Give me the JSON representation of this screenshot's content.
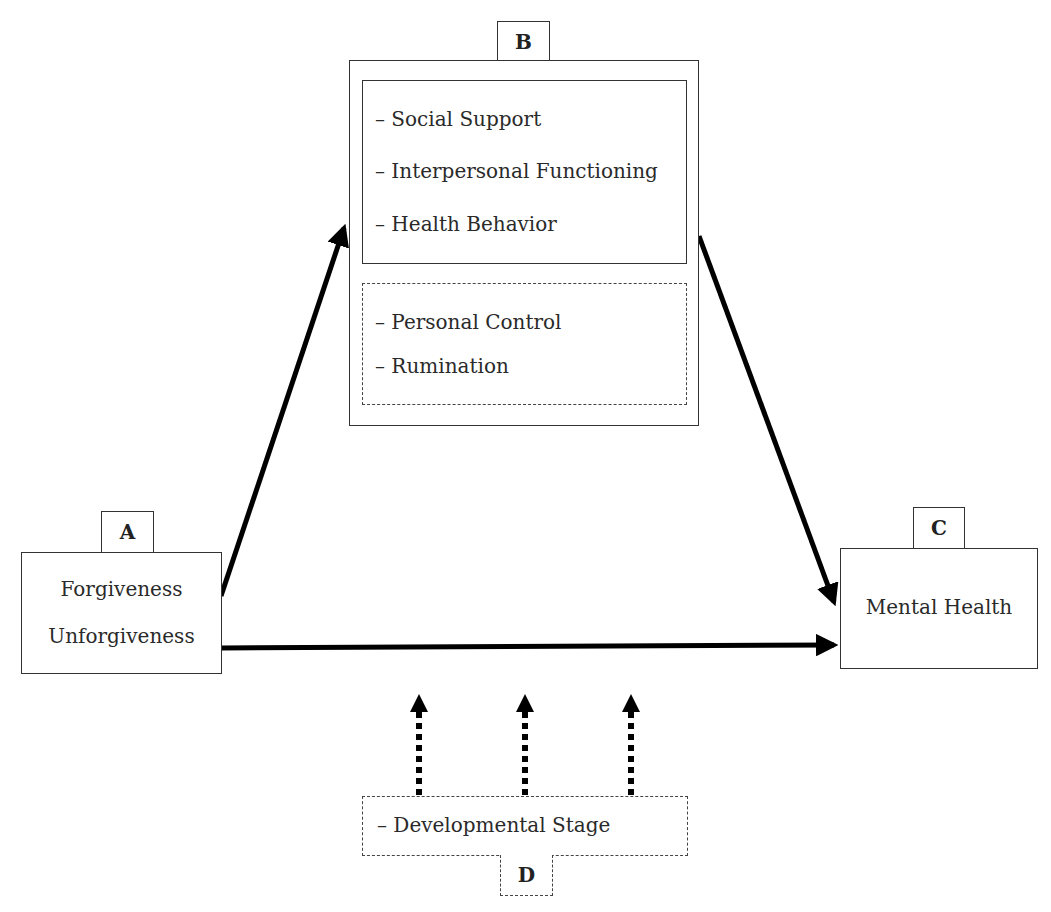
{
  "diagram": {
    "type": "conceptual model",
    "nodes": {
      "A": {
        "tag": "A",
        "lines": [
          "Forgiveness",
          "Unforgiveness"
        ]
      },
      "B": {
        "tag": "B",
        "solid_group": [
          "– Social Support",
          "– Interpersonal Functioning",
          "– Health Behavior"
        ],
        "dashed_group": [
          "– Personal Control",
          "– Rumination"
        ]
      },
      "C": {
        "tag": "C",
        "lines": [
          "Mental Health"
        ]
      },
      "D": {
        "tag": "D",
        "lines": [
          "– Developmental Stage"
        ]
      }
    },
    "edges": [
      {
        "from": "A",
        "to": "B",
        "style": "solid"
      },
      {
        "from": "B",
        "to": "C",
        "style": "solid"
      },
      {
        "from": "A",
        "to": "C",
        "style": "solid"
      },
      {
        "from": "D",
        "to": "A-C path",
        "style": "dotted",
        "count": 3
      }
    ],
    "colors": {
      "stroke": "#333333",
      "arrow": "#000000",
      "background": "#ffffff"
    }
  }
}
